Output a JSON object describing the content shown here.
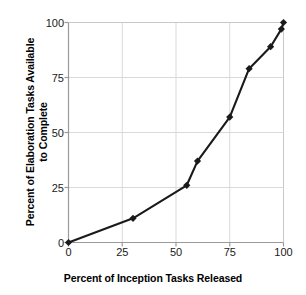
{
  "chart_data": {
    "type": "line",
    "title": "",
    "xlabel": "Percent of Inception Tasks Released",
    "ylabel": "Percent of Elaboration Tasks Available to Complete",
    "ylabel_line1": "Percent of Elaboration Tasks Available",
    "ylabel_line2": "to Complete",
    "xlim": [
      0,
      100
    ],
    "ylim": [
      0,
      100
    ],
    "xticks": [
      0,
      25,
      50,
      75,
      100
    ],
    "yticks": [
      0,
      25,
      50,
      75,
      100
    ],
    "xtick_labels": [
      "0",
      "25",
      "50",
      "75",
      "100"
    ],
    "ytick_labels": [
      "0",
      "25",
      "50",
      "75",
      "100"
    ],
    "grid": true,
    "legend": false,
    "legend_position": "none",
    "marker": "diamond",
    "line_color": "#1a1a1a",
    "marker_color": "#1a1a1a",
    "grid_color": "#d9d9d9",
    "axis_color": "#808080",
    "series": [
      {
        "name": "Elaboration tasks available",
        "points": [
          {
            "x": 0,
            "y": 0
          },
          {
            "x": 30,
            "y": 11
          },
          {
            "x": 55,
            "y": 26
          },
          {
            "x": 60,
            "y": 37
          },
          {
            "x": 75,
            "y": 57
          },
          {
            "x": 84,
            "y": 79
          },
          {
            "x": 94,
            "y": 89
          },
          {
            "x": 99,
            "y": 97
          },
          {
            "x": 100,
            "y": 100
          }
        ]
      }
    ]
  }
}
